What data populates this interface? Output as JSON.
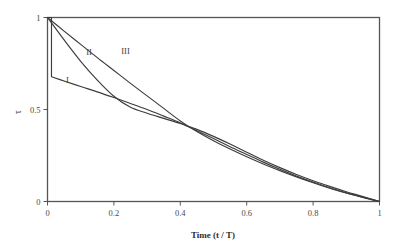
{
  "chart_data": {
    "type": "line",
    "title": "",
    "subtitle": "",
    "xlabel": "Time (t / T)",
    "ylabel": "τ",
    "xlim": [
      0,
      1
    ],
    "ylim": [
      0,
      1
    ],
    "grid": false,
    "legend_position": "inline-annotations",
    "xticks": [
      "0",
      "0.2",
      "0.4",
      "0.6",
      "0.8",
      "1"
    ],
    "xtick_values": [
      0,
      0.2,
      0.4,
      0.6,
      0.8,
      1
    ],
    "yticks": [
      "0",
      "0.5",
      "1"
    ],
    "ytick_values": [
      0,
      0.5,
      1
    ],
    "annotations": [
      {
        "text": "I",
        "x": 0.06,
        "y": 0.645
      },
      {
        "text": "II",
        "x": 0.125,
        "y": 0.795
      },
      {
        "text": "III",
        "x": 0.235,
        "y": 0.8
      }
    ],
    "series": [
      {
        "name": "I",
        "label": "I",
        "color": "#3c3c3c",
        "x": [
          0,
          0.012,
          0.012,
          0.05,
          0.1,
          0.15,
          0.2,
          0.25,
          0.3,
          0.35,
          0.4,
          0.45,
          0.5,
          0.55,
          0.6,
          0.65,
          0.7,
          0.75,
          0.8,
          0.85,
          0.9,
          0.94,
          0.97,
          1.0
        ],
        "y": [
          1.0,
          1.0,
          0.678,
          0.655,
          0.625,
          0.596,
          0.565,
          0.533,
          0.5,
          0.464,
          0.427,
          0.385,
          0.342,
          0.298,
          0.256,
          0.214,
          0.175,
          0.139,
          0.106,
          0.075,
          0.047,
          0.028,
          0.014,
          0.0
        ]
      },
      {
        "name": "II",
        "label": "II",
        "color": "#3c3c3c",
        "x": [
          0,
          0.05,
          0.1,
          0.15,
          0.2,
          0.25,
          0.3,
          0.35,
          0.4,
          0.45,
          0.5,
          0.55,
          0.6,
          0.65,
          0.7,
          0.75,
          0.8,
          0.85,
          0.9,
          0.94,
          0.97,
          1.0
        ],
        "y": [
          1.0,
          0.878,
          0.762,
          0.66,
          0.572,
          0.512,
          0.48,
          0.452,
          0.424,
          0.392,
          0.354,
          0.312,
          0.268,
          0.224,
          0.184,
          0.147,
          0.113,
          0.082,
          0.053,
          0.032,
          0.016,
          0.0
        ]
      },
      {
        "name": "III",
        "label": "III",
        "color": "#3c3c3c",
        "x": [
          0,
          0.05,
          0.1,
          0.15,
          0.2,
          0.25,
          0.3,
          0.35,
          0.4,
          0.45,
          0.5,
          0.55,
          0.6,
          0.65,
          0.7,
          0.75,
          0.8,
          0.85,
          0.9,
          0.95,
          1.0
        ],
        "y": [
          1.0,
          0.926,
          0.854,
          0.782,
          0.712,
          0.642,
          0.574,
          0.506,
          0.438,
          0.38,
          0.33,
          0.285,
          0.243,
          0.204,
          0.168,
          0.134,
          0.102,
          0.072,
          0.046,
          0.022,
          0.0
        ]
      }
    ]
  }
}
